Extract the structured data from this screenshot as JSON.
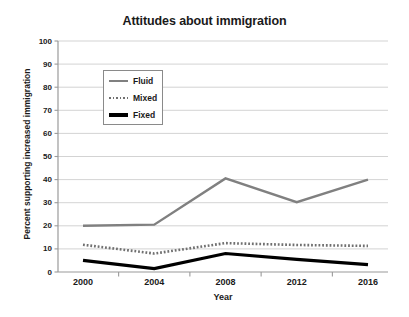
{
  "chart_data": {
    "type": "line",
    "title": "Attitudes about immigration",
    "xlabel": "Year",
    "ylabel": "Percent supporting increased immigration",
    "categories": [
      "2000",
      "2004",
      "2008",
      "2012",
      "2016"
    ],
    "x": [
      2000,
      2004,
      2008,
      2012,
      2016
    ],
    "xlim": [
      2000,
      2016
    ],
    "ylim": [
      0,
      100
    ],
    "yticks": [
      0,
      10,
      20,
      30,
      40,
      50,
      60,
      70,
      80,
      90,
      100
    ],
    "ytick_labels": [
      "0",
      "10",
      "20",
      "30",
      "40",
      "50",
      "60",
      "70",
      "80",
      "90",
      "100"
    ],
    "grid": "horizontal",
    "legend_position": "upper-left-inside",
    "series": [
      {
        "name": "Fluid",
        "values": [
          20,
          20.5,
          40.5,
          30.2,
          40
        ],
        "color": "#808080",
        "style": "solid",
        "width": 2.4
      },
      {
        "name": "Mixed",
        "values": [
          11.8,
          8,
          12.5,
          11.7,
          11.3
        ],
        "color": "#707070",
        "style": "dotted",
        "width": 2.6
      },
      {
        "name": "Fixed",
        "values": [
          5,
          1.5,
          8,
          5.5,
          3.2
        ],
        "color": "#000000",
        "style": "solid",
        "width": 3.2
      }
    ]
  },
  "axes": {
    "axis_color": "#9a9a9a",
    "grid_color": "#c8c8c8",
    "tick_color": "#9a9a9a"
  },
  "legend": {
    "items": [
      {
        "label": "Fluid",
        "swatch": "fluid-line-swatch"
      },
      {
        "label": "Mixed",
        "swatch": "mixed-dotted-swatch"
      },
      {
        "label": "Fixed",
        "swatch": "fixed-line-swatch"
      }
    ]
  }
}
